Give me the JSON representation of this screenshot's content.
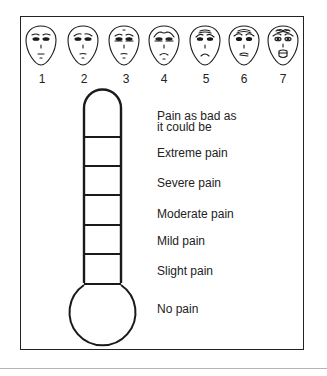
{
  "faces": {
    "labels": [
      "1",
      "2",
      "3",
      "4",
      "5",
      "6",
      "7"
    ],
    "description": [
      "neutral face",
      "slightly worried face",
      "worried face",
      "frowning face",
      "distressed face",
      "grimacing face",
      "screaming face"
    ]
  },
  "thermometer": {
    "levels": [
      {
        "line1": "Pain as bad as",
        "line2": "it could be"
      },
      {
        "line1": "Extreme pain"
      },
      {
        "line1": "Severe pain"
      },
      {
        "line1": "Moderate pain"
      },
      {
        "line1": "Mild pain"
      },
      {
        "line1": "Slight pain"
      },
      {
        "line1": "No pain"
      }
    ]
  },
  "colors": {
    "ink": "#1a1a1a",
    "frame": "#222222",
    "rule": "#b5b5b5",
    "background": "#ffffff"
  }
}
